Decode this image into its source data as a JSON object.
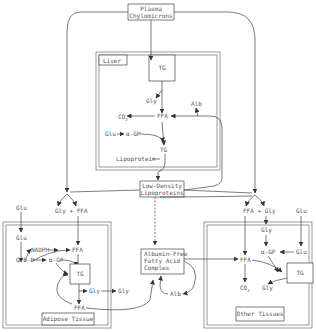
{
  "diagram": {
    "title_box": {
      "line1": "Plasma",
      "line2": "Chylomicrons"
    },
    "liver": {
      "label": "Liver",
      "tg_top": "TG",
      "gly": "Gly",
      "co2": "CO",
      "co2_sub": "2",
      "ffa": "FFA",
      "alb": "Alb",
      "glu": "Glu",
      "agp": "α-GP",
      "tg_bottom": "TG",
      "lipoprotein": "Lipoprotein"
    },
    "ldl": {
      "line1": "Low-Density",
      "line2": "Lipoproteins"
    },
    "center_left": "Gly + FFA",
    "center_right": "FFA + Gly",
    "adipose": {
      "label": "Adipose Tissue",
      "glu_out": "Glu",
      "glu_in": "Glu",
      "nadph": "NADPH",
      "ffa_top": "FFA",
      "g6p": "G-6-P",
      "agp": "α-GP",
      "tg": "TG",
      "gly_inner": "Gly",
      "gly_outer": "Gly",
      "ffa_bottom": "FFA"
    },
    "albumin_complex": {
      "line1": "Albumin-Free",
      "line2": "Fatty Acid",
      "line3": "Complex"
    },
    "alb_center": "Alb",
    "other": {
      "label": "Other Tissues",
      "glu_out": "Glu",
      "glu_in": "Glu",
      "gly_top": "Gly",
      "agp": "α-GP",
      "ffa": "FFA",
      "tg": "TG",
      "co2": "CO",
      "co2_sub": "2",
      "gly_bottom": "Gly"
    }
  }
}
